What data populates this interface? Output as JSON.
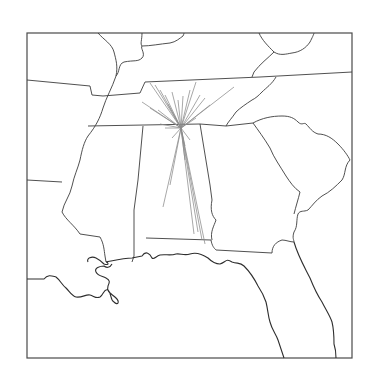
{
  "map": {
    "title": "",
    "region": "Southeastern United States",
    "frame": {
      "x": 27,
      "y": 33,
      "width": 325,
      "height": 325
    },
    "colors": {
      "background": "#ffffff",
      "border_stroke": "#3c3c3c",
      "flow_stroke": "#8c8c8c"
    },
    "hub": {
      "x": 181,
      "y": 128
    },
    "flow_endpoints": [
      [
        150,
        83
      ],
      [
        155,
        85
      ],
      [
        160,
        90
      ],
      [
        165,
        95
      ],
      [
        142,
        102
      ],
      [
        150,
        108
      ],
      [
        158,
        110
      ],
      [
        168,
        104
      ],
      [
        172,
        92
      ],
      [
        178,
        100
      ],
      [
        183,
        96
      ],
      [
        190,
        90
      ],
      [
        196,
        82
      ],
      [
        200,
        95
      ],
      [
        205,
        98
      ],
      [
        210,
        105
      ],
      [
        234,
        87
      ],
      [
        196,
        118
      ],
      [
        160,
        124
      ],
      [
        165,
        128
      ],
      [
        172,
        138
      ],
      [
        185,
        146
      ],
      [
        190,
        140
      ],
      [
        170,
        185
      ],
      [
        163,
        207
      ],
      [
        198,
        232
      ],
      [
        202,
        240
      ],
      [
        205,
        244
      ],
      [
        194,
        234
      ],
      [
        185,
        160
      ]
    ]
  }
}
